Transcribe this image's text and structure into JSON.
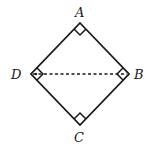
{
  "diagram": {
    "type": "geometry",
    "shape": "square (rotated 45°)",
    "vertices": [
      {
        "name": "A",
        "position": "top"
      },
      {
        "name": "B",
        "position": "right"
      },
      {
        "name": "C",
        "position": "bottom"
      },
      {
        "name": "D",
        "position": "left"
      }
    ],
    "labels": {
      "A": "A",
      "B": "B",
      "C": "C",
      "D": "D"
    },
    "edges": [
      "AB",
      "BC",
      "CD",
      "DA"
    ],
    "dashed_segments": [
      "DB"
    ],
    "right_angle_markers": [
      "A",
      "B",
      "C",
      "D"
    ],
    "colors": {
      "stroke": "#1a1a1a",
      "background": "#ffffff"
    }
  }
}
